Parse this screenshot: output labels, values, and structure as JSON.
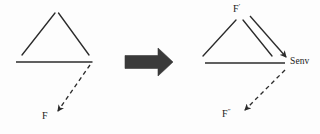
{
  "figure": {
    "background_color": "#fdfdfd",
    "stroke_color": "#2b2b2b",
    "arrow_fill_color": "#3a3a3a",
    "width": 320,
    "height": 134
  },
  "left_panel": {
    "name": "before-state",
    "labels": {
      "force": "F",
      "force_prime_marker": ""
    },
    "shapes": {
      "apex_point": "55,12",
      "left_diagonal": "(55,13) to (22,55)",
      "right_diagonal": "(58,13) to (88,55)",
      "baseline": "(16,62) to (92,62)",
      "dashed_arrow": "(90,64) to (57,112)"
    }
  },
  "transform_arrow": {
    "name": "block-arrow-right",
    "symbol": "➡",
    "direction": "right",
    "from_x": 125,
    "to_x": 173,
    "center_y": 62
  },
  "right_panel": {
    "name": "after-state",
    "labels": {
      "force_prime": "F",
      "force_prime_sup": "′",
      "senv": "Senv",
      "force_double_prime": "F",
      "force_double_prime_sup": "″"
    },
    "shapes": {
      "apex_point": "240,12",
      "left_diagonal": "(235,20) to (203,56)",
      "middle_diagonal": "(242,20) to (272,56)",
      "arrow_diagonal": "(248,17) to (287,58)",
      "baseline": "(205,63) to (285,63)",
      "dashed_arrow": "(285,69) to (243,112)"
    }
  }
}
